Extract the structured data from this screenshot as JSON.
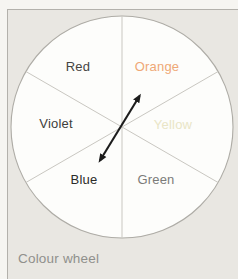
{
  "figure": {
    "caption": "Colour wheel"
  },
  "wheel": {
    "segments": [
      {
        "label": "Red",
        "color": "#454543"
      },
      {
        "label": "Orange",
        "color": "#efa876"
      },
      {
        "label": "Yellow",
        "color": "#e9e5c6"
      },
      {
        "label": "Green",
        "color": "#7b7b79"
      },
      {
        "label": "Blue",
        "color": "#2b2b29"
      },
      {
        "label": "Violet",
        "color": "#3e3e3c"
      }
    ],
    "arrow": {
      "connects": "Blue - Orange",
      "color": "#1c1c1c"
    }
  },
  "colors": {
    "outer_background": "#f6f5f1",
    "panel_background": "#e9e7e2",
    "panel_border": "#b3b1ab",
    "circle_fill": "#fdfdfb",
    "circle_stroke": "#aeaca6",
    "divider_stroke": "#c9c7c1",
    "caption_color": "#90908c"
  }
}
